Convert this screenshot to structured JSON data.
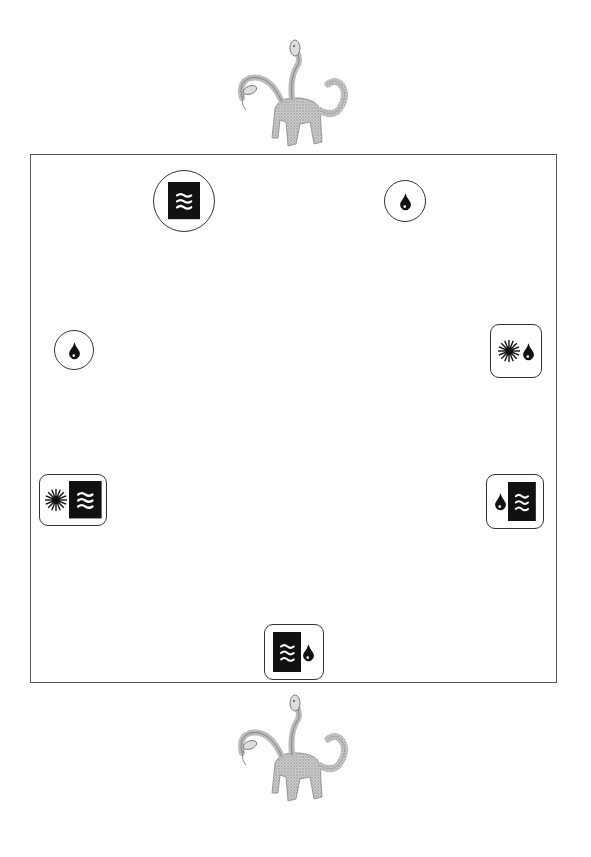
{
  "image": {
    "width": 591,
    "height": 857,
    "background": "#ffffff",
    "ink_color": "#111111",
    "frame_color": "#555555"
  },
  "decorations": [
    {
      "name": "creature-top",
      "icon": "multi-headed-serpent-beast-icon",
      "x": 230,
      "y": 38
    },
    {
      "name": "creature-bottom",
      "icon": "multi-headed-serpent-beast-icon",
      "x": 230,
      "y": 693
    }
  ],
  "board": {
    "x": 30,
    "y": 154,
    "width": 527,
    "height": 529
  },
  "tokens": [
    {
      "name": "token-top-left",
      "shape": "circle",
      "x": 153,
      "y": 170,
      "w": 62,
      "h": 62,
      "symbols": [
        "water-waves"
      ]
    },
    {
      "name": "token-top-right",
      "shape": "circle",
      "x": 384,
      "y": 180,
      "w": 42,
      "h": 42,
      "symbols": [
        "water-drop"
      ]
    },
    {
      "name": "token-mid-left",
      "shape": "circle",
      "x": 54,
      "y": 330,
      "w": 40,
      "h": 40,
      "symbols": [
        "water-drop"
      ]
    },
    {
      "name": "token-mid-right",
      "shape": "rounded",
      "x": 490,
      "y": 324,
      "w": 52,
      "h": 54,
      "symbols": [
        "sun",
        "water-drop"
      ]
    },
    {
      "name": "token-lower-left",
      "shape": "rounded",
      "x": 39,
      "y": 474,
      "w": 68,
      "h": 52,
      "symbols": [
        "sun",
        "water-waves"
      ]
    },
    {
      "name": "token-lower-right",
      "shape": "rounded",
      "x": 486,
      "y": 474,
      "w": 58,
      "h": 55,
      "symbols": [
        "water-drop",
        "water-waves"
      ]
    },
    {
      "name": "token-bottom-center",
      "shape": "rounded",
      "x": 264,
      "y": 624,
      "w": 60,
      "h": 56,
      "symbols": [
        "water-waves",
        "water-drop"
      ]
    }
  ]
}
